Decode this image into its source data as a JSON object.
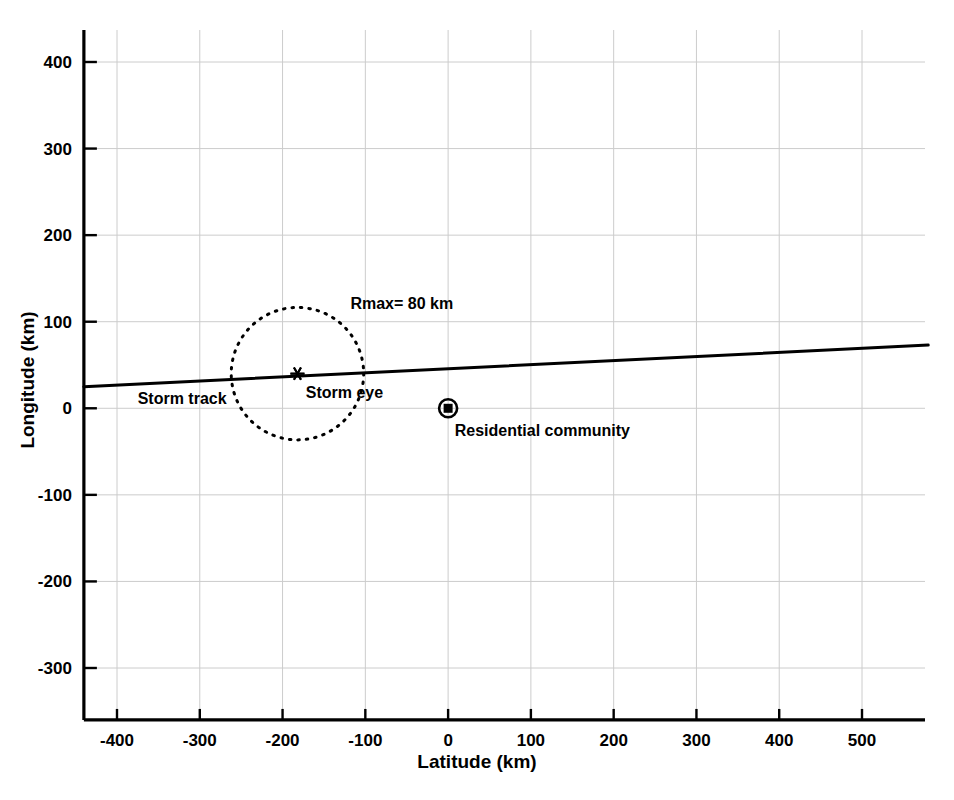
{
  "chart_data": {
    "type": "line",
    "title": "",
    "subtitle": "",
    "xlabel": "Latitude (km)",
    "ylabel": "Longitude (km)",
    "xlim": [
      -440,
      580
    ],
    "ylim": [
      -360,
      440
    ],
    "xticks": [
      -400,
      -300,
      -200,
      -100,
      0,
      100,
      200,
      300,
      400,
      500
    ],
    "xtick_labels": [
      "-400",
      "-300",
      "-200",
      "-100",
      "0",
      "100",
      "200",
      "300",
      "400",
      "500"
    ],
    "yticks": [
      -300,
      -200,
      -100,
      0,
      100,
      200,
      300,
      400
    ],
    "ytick_labels": [
      "-300",
      "-200",
      "-100",
      "0",
      "100",
      "200",
      "300",
      "400"
    ],
    "grid": true,
    "grid_color": "#cccccc",
    "legend_position": "none",
    "series": [
      {
        "name": "Storm track",
        "type": "line",
        "style": "solid",
        "color": "#000000",
        "x": [
          -440,
          580
        ],
        "y": [
          25,
          73
        ]
      }
    ],
    "markers": [
      {
        "name": "Storm eye",
        "label": "Storm eye",
        "glyph": "star",
        "x": -182,
        "y": 40,
        "color": "#000000"
      },
      {
        "name": "Residential community",
        "label": "Residential community",
        "glyph": "circle-with-filled-square",
        "x": 0,
        "y": 0,
        "color": "#000000"
      }
    ],
    "shapes": [
      {
        "name": "Rmax circle",
        "type": "circle",
        "style": "dotted",
        "color": "#000000",
        "center_x": -182,
        "center_y": 40,
        "radius_km": 80,
        "label": "Rmax= 80 km"
      }
    ],
    "annotations": [
      {
        "name": "rmax-label",
        "text": "Rmax= 80 km",
        "x": -118,
        "y": 115
      },
      {
        "name": "storm-track-label",
        "text": "Storm track",
        "x": -375,
        "y": 5
      },
      {
        "name": "storm-eye-label",
        "text": "Storm eye",
        "x": -172,
        "y": 12
      },
      {
        "name": "residential-community-label",
        "text": "Residential community",
        "x": 8,
        "y": -32
      }
    ]
  },
  "axes": {
    "x_title": "Latitude (km)",
    "y_title": "Longitude (km)"
  }
}
